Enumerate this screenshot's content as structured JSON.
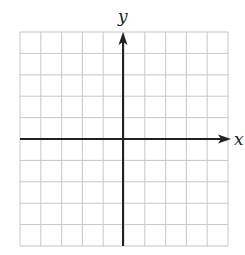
{
  "diagram": {
    "type": "coordinate-grid",
    "x_axis_label": "x",
    "y_axis_label": "y",
    "grid": {
      "columns": 10,
      "rows": 10,
      "left": 20,
      "top": 32,
      "right": 228,
      "bottom": 246,
      "line_color": "#c8c8c8"
    },
    "axes": {
      "origin_x": 123,
      "origin_y": 139,
      "color": "#222222",
      "x_axis_start": 20,
      "x_axis_arrow_tip": 231,
      "y_axis_end": 246,
      "y_axis_arrow_tip": 32
    }
  }
}
